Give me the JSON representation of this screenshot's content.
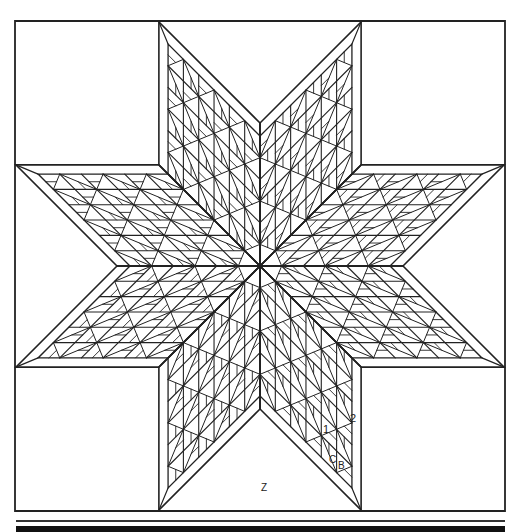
{
  "diagram": {
    "stroke_color": "#222222",
    "background": "#ffffff",
    "outer_square": {
      "x": 15,
      "y": 21,
      "size": 490
    },
    "center": {
      "x": 260,
      "y": 266
    },
    "diamond_side": 143,
    "border_width": 10,
    "grid_divisions": 6,
    "points": 8
  },
  "labels": {
    "piece_1": "1",
    "piece_2": "2",
    "piece_c": "C",
    "piece_b": "B",
    "background_z": "Z"
  },
  "rules": {
    "thin_y": 521,
    "thick_y": 526
  }
}
